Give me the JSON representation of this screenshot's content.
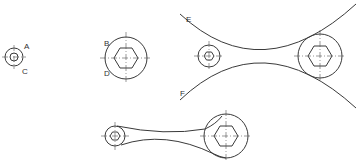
{
  "figures": [
    {
      "id": "step-1",
      "description": "Small circle with concentric inner circle",
      "labels": {
        "a": "A",
        "c": "C"
      }
    },
    {
      "id": "step-2",
      "description": "Large circle with hexagon",
      "labels": {
        "b": "B",
        "d": "D"
      }
    },
    {
      "id": "step-3",
      "description": "Two bosses with tangent construction arcs",
      "labels": {
        "e": "E",
        "f": "F"
      }
    },
    {
      "id": "step-4",
      "description": "Completed wrench-like link with trimmed arcs"
    }
  ],
  "colors": {
    "line": "#3a3a3a",
    "text": "#333333",
    "background": "#ffffff"
  }
}
